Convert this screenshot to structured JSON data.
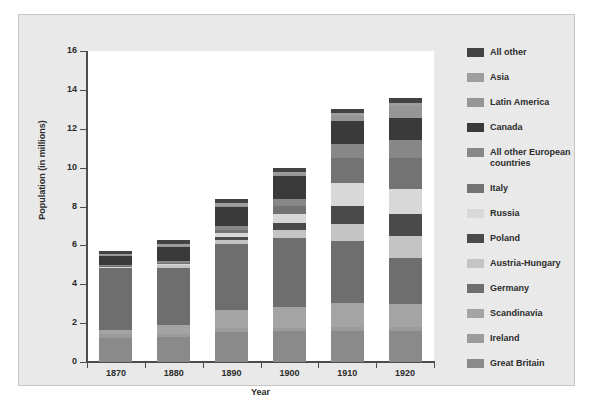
{
  "chart_data": {
    "type": "bar",
    "subtype": "stacked-bar",
    "title": "",
    "xlabel": "Year",
    "ylabel": "Population (in millions)",
    "categories": [
      "1870",
      "1880",
      "1890",
      "1900",
      "1910",
      "1920"
    ],
    "ylim": [
      0,
      16
    ],
    "yticks": [
      0,
      2,
      4,
      6,
      8,
      10,
      12,
      14,
      16
    ],
    "ytick_labels": [
      "0",
      "2",
      "4",
      "6",
      "8",
      "10",
      "12",
      "14",
      "16"
    ],
    "grid": false,
    "legend_position": "right",
    "axis_background": "#ffffff",
    "figure_background": "#e9e9e9",
    "series": [
      {
        "name": "Great Britain",
        "color": "#8a8a8a",
        "values": [
          1.22,
          1.28,
          1.56,
          1.57,
          1.59,
          1.62
        ]
      },
      {
        "name": "Ireland",
        "color": "#9b9b9b",
        "values": [
          0.2,
          0.18,
          0.19,
          0.2,
          0.2,
          0.18
        ]
      },
      {
        "name": "Scandinavia",
        "color": "#a4a4a4",
        "values": [
          0.24,
          0.44,
          0.93,
          1.07,
          1.25,
          1.18
        ]
      },
      {
        "name": "Germany",
        "color": "#6e6e6e",
        "values": [
          3.17,
          2.95,
          3.37,
          3.52,
          3.2,
          2.38
        ]
      },
      {
        "name": "Austria-Hungary",
        "color": "#c4c4c4",
        "values": [
          0.04,
          0.12,
          0.24,
          0.43,
          0.85,
          1.1
        ]
      },
      {
        "name": "Poland",
        "color": "#4a4a4a",
        "values": [
          0.02,
          0.05,
          0.15,
          0.38,
          0.94,
          1.14
        ]
      },
      {
        "name": "Russia",
        "color": "#d8d8d8",
        "values": [
          0.01,
          0.04,
          0.18,
          0.42,
          1.18,
          1.32
        ]
      },
      {
        "name": "Italy",
        "color": "#737373",
        "values": [
          0.02,
          0.05,
          0.18,
          0.45,
          1.3,
          1.56
        ]
      },
      {
        "name": "All other European\ncountries",
        "color": "#878787",
        "values": [
          0.05,
          0.1,
          0.2,
          0.34,
          0.7,
          0.94
        ]
      },
      {
        "name": "Canada",
        "color": "#3a3a3a",
        "values": [
          0.5,
          0.72,
          1.0,
          1.18,
          1.21,
          1.14
        ]
      },
      {
        "name": "Latin America",
        "color": "#969696",
        "values": [
          0.02,
          0.03,
          0.05,
          0.11,
          0.25,
          0.62
        ]
      },
      {
        "name": "Asia",
        "color": "#9e9e9e",
        "values": [
          0.06,
          0.11,
          0.13,
          0.13,
          0.15,
          0.17
        ]
      },
      {
        "name": "All other",
        "color": "#434343",
        "values": [
          0.15,
          0.2,
          0.2,
          0.18,
          0.2,
          0.23
        ]
      }
    ],
    "totals": [
      5.97,
      6.93,
      9.25,
      10.37,
      13.41,
      14.53
    ]
  },
  "axes": {
    "x_label": "Year",
    "y_label": "Population (in millions)",
    "x_tick_labels": [
      "1870",
      "1880",
      "1890",
      "1900",
      "1910",
      "1920"
    ],
    "y_tick_labels": [
      "16",
      "14",
      "12",
      "10",
      "8",
      "6",
      "4",
      "2",
      "0"
    ]
  },
  "legend": {
    "items": [
      {
        "label": "All other",
        "color": "#434343"
      },
      {
        "label": "Asia",
        "color": "#9e9e9e"
      },
      {
        "label": "Latin America",
        "color": "#969696"
      },
      {
        "label": "Canada",
        "color": "#3a3a3a"
      },
      {
        "label": "All other European\ncountries",
        "color": "#878787"
      },
      {
        "label": "Italy",
        "color": "#737373"
      },
      {
        "label": "Russia",
        "color": "#d8d8d8"
      },
      {
        "label": "Poland",
        "color": "#4a4a4a"
      },
      {
        "label": "Austria-Hungary",
        "color": "#c4c4c4"
      },
      {
        "label": "Germany",
        "color": "#6e6e6e"
      },
      {
        "label": "Scandinavia",
        "color": "#a4a4a4"
      },
      {
        "label": "Ireland",
        "color": "#9b9b9b"
      },
      {
        "label": "Great Britain",
        "color": "#8a8a8a"
      }
    ]
  }
}
